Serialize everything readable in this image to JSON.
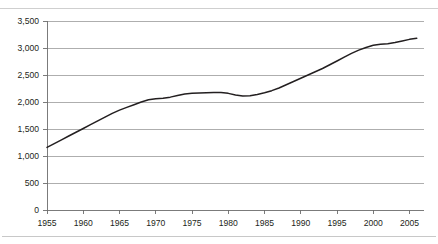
{
  "figure": {
    "partial_title_fragment": "",
    "background_color": "#ffffff"
  },
  "chart_data": {
    "type": "line",
    "title": "",
    "subtitle": "",
    "xlabel": "",
    "ylabel": "",
    "grid": "horizontal",
    "legend_position": "none",
    "line_color": "#231f20",
    "gridline_color": "#8b8b8b",
    "axis_color": "#6d6d6d",
    "xlim": [
      1955,
      2007
    ],
    "ylim": [
      0,
      3500
    ],
    "y_tick_labels": [
      "0",
      "500",
      "1,000",
      "1,500",
      "2,000",
      "2,500",
      "3,000",
      "3,500"
    ],
    "y_tick_values": [
      0,
      500,
      1000,
      1500,
      2000,
      2500,
      3000,
      3500
    ],
    "x_tick_labels": [
      "1955",
      "1960",
      "1965",
      "1970",
      "1975",
      "1980",
      "1985",
      "1990",
      "1995",
      "2000",
      "2005"
    ],
    "x_tick_values": [
      1955,
      1960,
      1965,
      1970,
      1975,
      1980,
      1985,
      1990,
      1995,
      2000,
      2005
    ],
    "series": [
      {
        "name": "series-1",
        "x": [
          1955,
          1956,
          1957,
          1958,
          1959,
          1960,
          1961,
          1962,
          1963,
          1964,
          1965,
          1966,
          1967,
          1968,
          1969,
          1970,
          1971,
          1972,
          1973,
          1974,
          1975,
          1976,
          1977,
          1978,
          1979,
          1980,
          1981,
          1982,
          1983,
          1984,
          1985,
          1986,
          1987,
          1988,
          1989,
          1990,
          1991,
          1992,
          1993,
          1994,
          1995,
          1996,
          1997,
          1998,
          1999,
          2000,
          2001,
          2002,
          2003,
          2004,
          2005,
          2006
        ],
        "values": [
          1160,
          1230,
          1300,
          1370,
          1440,
          1510,
          1580,
          1650,
          1720,
          1790,
          1850,
          1900,
          1950,
          2000,
          2040,
          2060,
          2070,
          2090,
          2120,
          2150,
          2160,
          2165,
          2170,
          2175,
          2175,
          2160,
          2130,
          2110,
          2115,
          2140,
          2170,
          2210,
          2260,
          2320,
          2380,
          2440,
          2500,
          2560,
          2620,
          2690,
          2760,
          2830,
          2900,
          2960,
          3010,
          3050,
          3070,
          3080,
          3100,
          3130,
          3160,
          3180
        ]
      }
    ]
  }
}
